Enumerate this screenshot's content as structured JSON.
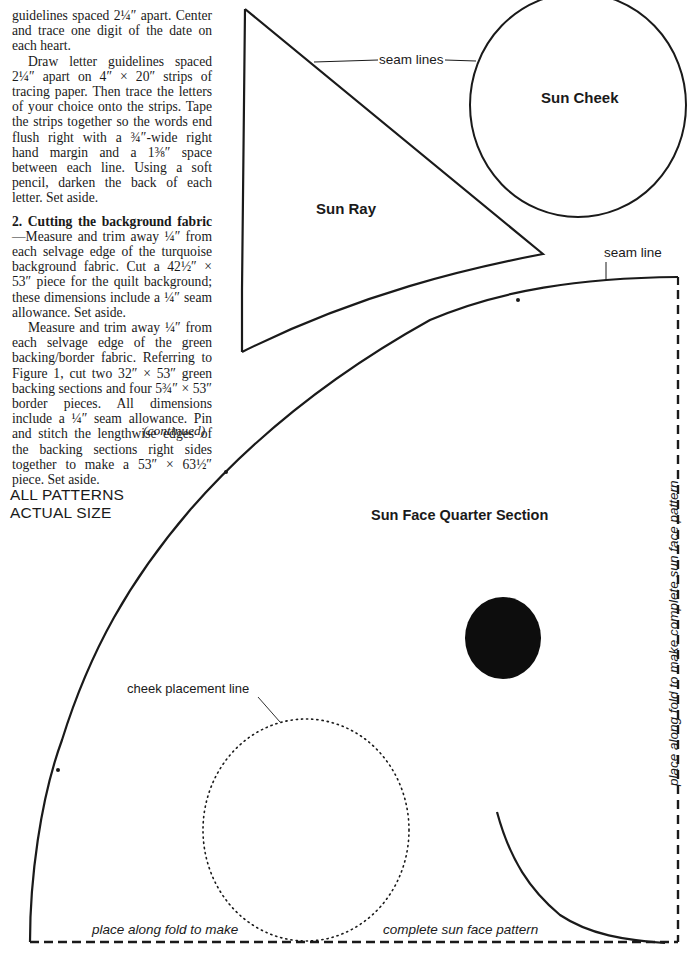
{
  "article": {
    "para1": "guidelines spaced 2¼″ apart. Center and trace one digit of the date on each heart.",
    "para2": "Draw letter guidelines spaced 2¼″ apart on 4″ × 20″ strips of tracing paper. Then trace the letters of your choice onto the strips. Tape the strips together so the words end flush right with a ¾″-wide right hand margin and a 1⅜″ space between each line. Using a soft pencil, darken the back of each letter. Set aside.",
    "step2_heading": "2. Cutting the background fabric",
    "step2_body": "—Measure and trim away ¼″ from each selvage edge of the turquoise background fabric. Cut a 42½″ × 53″ piece for the quilt background; these dimensions include a ¼″ seam allowance. Set aside.",
    "para4": "Measure and trim away ¼″ from each selvage edge of the green backing/border fabric. Referring to Figure 1, cut two 32″ × 53″ green backing sections and four 5¾″ × 53″ border pieces. All dimensions include a ¼″ seam allowance. Pin and stitch the lengthwise edges of the backing sections right sides together to make a 53″ × 63½″ piece. Set aside.",
    "continued": "(continued)"
  },
  "patterns": {
    "scale_note_line1": "ALL PATTERNS",
    "scale_note_line2": "ACTUAL SIZE",
    "sun_ray_label": "Sun Ray",
    "sun_cheek_label": "Sun Cheek",
    "seam_lines_label": "seam lines",
    "seam_line_label": "seam line",
    "sun_face_label": "Sun Face Quarter Section",
    "cheek_placement_label": "cheek placement line",
    "fold_bottom_left": "place along fold to make",
    "fold_bottom_right": "complete sun face pattern",
    "fold_right_vertical": "place along fold to make complete sun face pattern"
  },
  "colors": {
    "ink": "#1a1a1a",
    "paper": "#ffffff"
  }
}
